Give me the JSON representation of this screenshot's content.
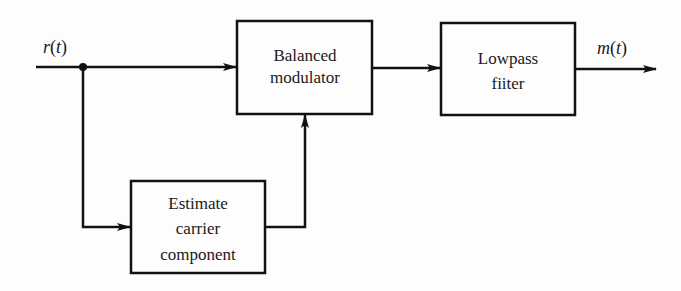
{
  "diagram": {
    "type": "block-diagram",
    "signals": {
      "input": {
        "name": "r",
        "arg": "t"
      },
      "output": {
        "name": "m",
        "arg": "t"
      }
    },
    "blocks": [
      {
        "id": "balanced_modulator",
        "lines": [
          "Balanced",
          "modulator"
        ]
      },
      {
        "id": "lowpass_filter",
        "lines": [
          "Lowpass",
          "fiiter"
        ]
      },
      {
        "id": "estimate_carrier",
        "lines": [
          "Estimate",
          "carrier",
          "component"
        ]
      }
    ],
    "connections": [
      {
        "from": "input r(t)",
        "to": "balanced_modulator"
      },
      {
        "from": "input r(t) (junction)",
        "to": "estimate_carrier"
      },
      {
        "from": "estimate_carrier",
        "to": "balanced_modulator"
      },
      {
        "from": "balanced_modulator",
        "to": "lowpass_filter"
      },
      {
        "from": "lowpass_filter",
        "to": "output m(t)"
      }
    ],
    "colors": {
      "line": "#111111",
      "background": "#fdfdfd"
    }
  }
}
